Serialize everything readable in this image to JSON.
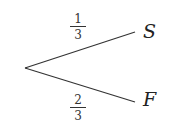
{
  "diagram": {
    "type": "probability-tree",
    "root": {
      "x": 25,
      "y": 68
    },
    "branches": [
      {
        "name": "upper",
        "end": {
          "x": 135,
          "y": 32
        },
        "probability": {
          "numerator": "1",
          "denominator": "3"
        },
        "outcome": "S"
      },
      {
        "name": "lower",
        "end": {
          "x": 135,
          "y": 102
        },
        "probability": {
          "numerator": "2",
          "denominator": "3"
        },
        "outcome": "F"
      }
    ],
    "line_color": "#333333"
  }
}
